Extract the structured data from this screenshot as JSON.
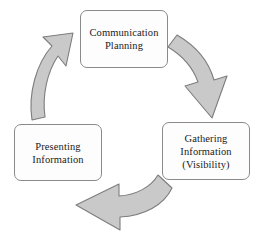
{
  "diagram": {
    "type": "cyclical-process",
    "direction": "clockwise",
    "background_color": "#ffffff",
    "node_fill_color": "#fdfdfd",
    "node_border_color": "#8a8a8a",
    "node_text_color": "#1b1b1b",
    "arrow_fill_color": "#c9c9c9",
    "arrow_stroke_color": "#7d7d7d",
    "nodes": [
      {
        "id": "communication-planning",
        "label": "Communication\nPlanning",
        "position": "top"
      },
      {
        "id": "gathering-information",
        "label": "Gathering\nInformation\n(Visibility)",
        "position": "bottom-right"
      },
      {
        "id": "presenting-information",
        "label": "Presenting\nInformation",
        "position": "bottom-left"
      }
    ],
    "arrows": [
      {
        "id": "arrow-planning-to-gathering",
        "from": "communication-planning",
        "to": "gathering-information",
        "direction": "down-right"
      },
      {
        "id": "arrow-gathering-to-presenting",
        "from": "gathering-information",
        "to": "presenting-information",
        "direction": "left"
      },
      {
        "id": "arrow-presenting-to-planning",
        "from": "presenting-information",
        "to": "communication-planning",
        "direction": "up-right"
      }
    ]
  }
}
